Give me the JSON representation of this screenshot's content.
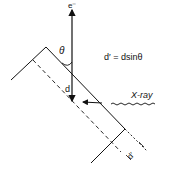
{
  "diagram": {
    "labels": {
      "electron": "e⁻",
      "theta": "θ",
      "d": "d",
      "equation": "d′ = dsinθ",
      "xray": "X-ray",
      "d_prime": "d′"
    },
    "colors": {
      "stroke": "#111111",
      "background": "#ffffff"
    }
  }
}
